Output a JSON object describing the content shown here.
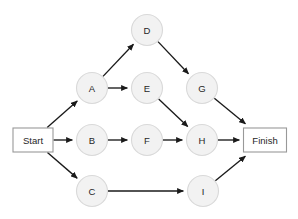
{
  "diagram": {
    "background_color": "#ffffff",
    "node_fill": "#f2f2f2",
    "node_stroke": "#d9d9d9",
    "box_fill": "#ffffff",
    "box_stroke": "#999999",
    "edge_color": "#1a1a1a",
    "text_color": "#262626",
    "nodes": [
      {
        "id": "start",
        "label": "Start",
        "shape": "rect",
        "x": 33,
        "y": 140,
        "w": 40,
        "h": 24
      },
      {
        "id": "A",
        "label": "A",
        "shape": "circle",
        "x": 92,
        "y": 88,
        "r": 15.5
      },
      {
        "id": "B",
        "label": "B",
        "shape": "circle",
        "x": 92,
        "y": 140,
        "r": 15.5
      },
      {
        "id": "C",
        "label": "C",
        "shape": "circle",
        "x": 92,
        "y": 191,
        "r": 15.5
      },
      {
        "id": "D",
        "label": "D",
        "shape": "circle",
        "x": 147,
        "y": 30,
        "r": 15.5
      },
      {
        "id": "E",
        "label": "E",
        "shape": "circle",
        "x": 147,
        "y": 88,
        "r": 15.5
      },
      {
        "id": "F",
        "label": "F",
        "shape": "circle",
        "x": 147,
        "y": 140,
        "r": 15.5
      },
      {
        "id": "G",
        "label": "G",
        "shape": "circle",
        "x": 202,
        "y": 88,
        "r": 15.5
      },
      {
        "id": "H",
        "label": "H",
        "shape": "circle",
        "x": 202,
        "y": 140,
        "r": 15.5
      },
      {
        "id": "I",
        "label": "I",
        "shape": "circle",
        "x": 203,
        "y": 191,
        "r": 15.5
      },
      {
        "id": "finish",
        "label": "Finish",
        "shape": "rect",
        "x": 265,
        "y": 140,
        "w": 43,
        "h": 24
      }
    ],
    "edges": [
      {
        "from": "start",
        "to": "A"
      },
      {
        "from": "start",
        "to": "B"
      },
      {
        "from": "start",
        "to": "C"
      },
      {
        "from": "A",
        "to": "D"
      },
      {
        "from": "A",
        "to": "E"
      },
      {
        "from": "D",
        "to": "G"
      },
      {
        "from": "E",
        "to": "H"
      },
      {
        "from": "B",
        "to": "F"
      },
      {
        "from": "F",
        "to": "H"
      },
      {
        "from": "C",
        "to": "I"
      },
      {
        "from": "G",
        "to": "finish"
      },
      {
        "from": "H",
        "to": "finish"
      },
      {
        "from": "I",
        "to": "finish"
      }
    ]
  }
}
